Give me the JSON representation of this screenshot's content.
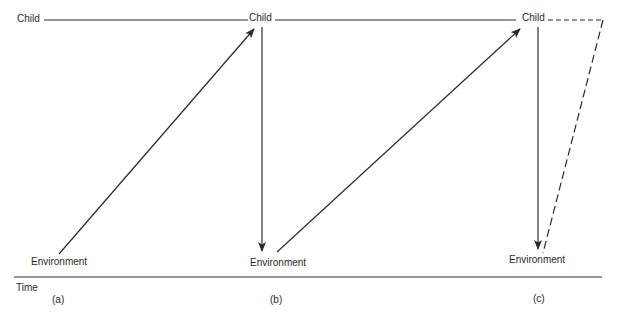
{
  "diagram": {
    "type": "timeline-interaction",
    "colors": {
      "line": "#2a2a2a",
      "background": "#ffffff"
    },
    "top_row": {
      "labels": [
        {
          "id": "child-a",
          "text": "Child"
        },
        {
          "id": "child-b",
          "text": "Child"
        },
        {
          "id": "child-c",
          "text": "Child"
        }
      ]
    },
    "bottom_row": {
      "labels": [
        {
          "id": "env-a",
          "text": "Environment"
        },
        {
          "id": "env-b",
          "text": "Environment"
        },
        {
          "id": "env-c",
          "text": "Environment"
        }
      ]
    },
    "time_axis": {
      "label": "Time",
      "markers": [
        "(a)",
        "(b)",
        "(c)"
      ]
    },
    "arrows": [
      {
        "from": "Environment (a)",
        "to": "Child (b)",
        "style": "solid"
      },
      {
        "from": "Child (b)",
        "to": "Environment (b)",
        "style": "solid"
      },
      {
        "from": "Environment (b)",
        "to": "Child (c)",
        "style": "solid"
      },
      {
        "from": "Child (c)",
        "to": "Environment (c)",
        "style": "solid"
      },
      {
        "from": "Child (c)",
        "to": "Environment (c)",
        "style": "dashed",
        "path": "loop"
      }
    ]
  }
}
